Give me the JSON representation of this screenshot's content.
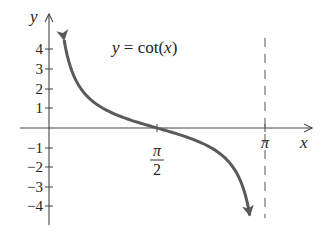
{
  "chart_data": {
    "type": "line",
    "title": "y = cot(x)",
    "xlabel": "x",
    "ylabel": "y",
    "xlim": [
      0,
      3.14159
    ],
    "ylim": [
      -4.5,
      4.5
    ],
    "x_ticks": [
      {
        "value": 1.5708,
        "label_num": "π",
        "label_den": "2"
      },
      {
        "value": 3.14159,
        "label": "π"
      }
    ],
    "y_ticks": [
      4,
      3,
      2,
      1,
      -1,
      -2,
      -3,
      -4
    ],
    "y_tick_labels": [
      "4",
      "3",
      "2",
      "1",
      "-1",
      "-2",
      "-3",
      "-4"
    ],
    "series": [
      {
        "name": "cot(x)",
        "function": "cot",
        "domain": [
          0.22,
          2.92
        ],
        "color": "#5a5a5a",
        "arrows": "both"
      }
    ],
    "asymptotes": [
      {
        "x": 3.14159,
        "style": "dashed"
      }
    ],
    "grid": false,
    "legend": "none"
  },
  "labels": {
    "equation": "y = cot(x)",
    "x_axis": "x",
    "y_axis": "y",
    "pi": "π",
    "pi_over_2_num": "π",
    "pi_over_2_den": "2"
  }
}
